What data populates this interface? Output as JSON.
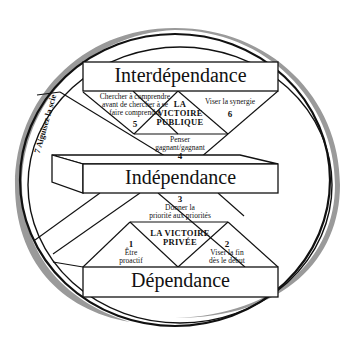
{
  "header": {
    "text": "LE PARADIGME ET LES PRINCIPES"
  },
  "diagram": {
    "levels": {
      "interdependance": "Interdépendance",
      "independance": "Indépendance",
      "dependance": "Dépendance"
    },
    "victories": {
      "public": [
        "LA",
        "VICTOIRE",
        "PUBLIQUE"
      ],
      "private": [
        "LA VICTOIRE",
        "PRIVÉE"
      ]
    },
    "habits": [
      {
        "num": "1",
        "lines": [
          "Être",
          "proactif"
        ]
      },
      {
        "num": "2",
        "lines": [
          "Viser la fin",
          "dès le début"
        ]
      },
      {
        "num": "3",
        "lines": [
          "Donner la",
          "priorité aux priorités"
        ]
      },
      {
        "num": "4",
        "lines": [
          "Penser",
          "gagnant/gagnant"
        ]
      },
      {
        "num": "5",
        "lines": [
          "Chercher à comprendre",
          "avant de chercher à se",
          "faire comprendre"
        ]
      },
      {
        "num": "6",
        "lines": [
          "Viser la synergie"
        ]
      },
      {
        "num": "7",
        "lines": [
          "7 Aiguisez la scie"
        ]
      }
    ]
  },
  "colors": {
    "ring": "#9a9a9a",
    "stroke": "#111111",
    "background": "#ffffff"
  }
}
